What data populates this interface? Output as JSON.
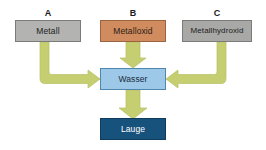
{
  "diagram": {
    "title_labels": [
      {
        "id": "A",
        "text": "A"
      },
      {
        "id": "B",
        "text": "B"
      },
      {
        "id": "C",
        "text": "C"
      }
    ],
    "nodes": {
      "metall": {
        "label": "Metall",
        "color": "#b3b3b1",
        "border": "#7b7b79"
      },
      "metalloxid": {
        "label": "Metalloxid",
        "color": "#d08c5f",
        "border": "#9a6440"
      },
      "metallhydroxid": {
        "label": "Metallhydroxid",
        "color": "#a8a8a6",
        "border": "#7b7b79"
      },
      "wasser": {
        "label": "Wasser",
        "color": "#9dc8e8",
        "border": "#4f86ae"
      },
      "lauge": {
        "label": "Lauge",
        "color": "#17527c",
        "border": "#0f3b5c"
      }
    },
    "arrows": {
      "color": "#c6ce72",
      "stroke": "#b5bd61",
      "items": [
        {
          "name": "metall-to-wasser",
          "from": "metall",
          "to": "wasser",
          "shape": "elbow-down-right"
        },
        {
          "name": "metalloxid-to-wasser",
          "from": "metalloxid",
          "to": "wasser",
          "shape": "straight-down"
        },
        {
          "name": "metallhydroxid-to-wasser",
          "from": "metallhydroxid",
          "to": "wasser",
          "shape": "elbow-down-left"
        },
        {
          "name": "wasser-to-lauge",
          "from": "wasser",
          "to": "lauge",
          "shape": "straight-down"
        }
      ]
    }
  }
}
